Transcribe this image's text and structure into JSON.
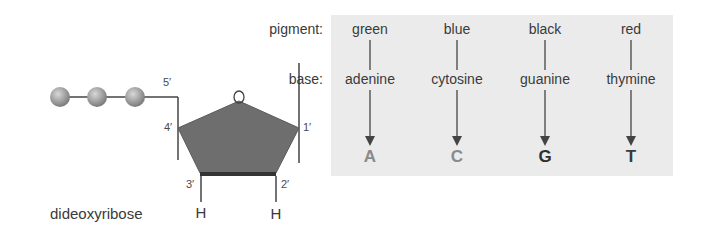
{
  "diagram": {
    "labels": {
      "pigment": "pigment:",
      "base": "base:",
      "sugar": "dideoxyribose",
      "ring_oxygen": "O",
      "carbons": {
        "c1": "1′",
        "c2": "2′",
        "c3": "3′",
        "c4": "4′",
        "c5": "5′"
      },
      "h2": "H",
      "h3": "H"
    },
    "columns": [
      {
        "pigment": "green",
        "base": "adenine",
        "letter": "A",
        "color": "#8a8a8a"
      },
      {
        "pigment": "blue",
        "base": "cytosine",
        "letter": "C",
        "color": "#8a8a8a"
      },
      {
        "pigment": "black",
        "base": "guanine",
        "letter": "G",
        "color": "#2e2e2e"
      },
      {
        "pigment": "red",
        "base": "thymine",
        "letter": "T",
        "color": "#3a3a3a"
      }
    ],
    "phosphate_count": 3,
    "colors": {
      "panel": "#ebebeb",
      "sugar_fill": "#6e6e6e",
      "sugar_edge": "#3f3f3f",
      "phosphate": "#9a9a9a",
      "line": "#444444"
    }
  }
}
